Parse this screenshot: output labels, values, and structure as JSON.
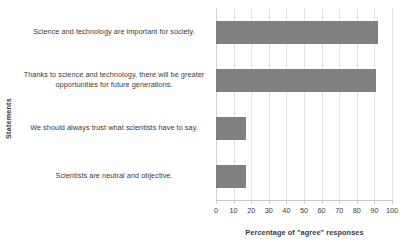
{
  "chart_data": {
    "type": "bar",
    "orientation": "horizontal",
    "title": "",
    "xlabel": "Percentage of \"agree\" responses",
    "ylabel": "Statements",
    "categories": [
      "Science and technology are important for society.",
      "Thanks to science and technology, there will be greater opportunities for future generations.",
      "We should always trust what scientists have to say.",
      "Scientists are neutral and objective."
    ],
    "values": [
      92,
      91,
      17,
      17
    ],
    "xlim": [
      0,
      100
    ],
    "xticks": [
      0,
      10,
      20,
      30,
      40,
      50,
      60,
      70,
      80,
      90,
      100
    ],
    "xtick_labels": [
      "0",
      "10",
      "20",
      "30",
      "40",
      "50",
      "60",
      "70",
      "80",
      "90",
      "100"
    ],
    "grid": true,
    "grid_axis": "x",
    "legend": false,
    "bar_color": "#808080",
    "gridline_color": "#e2e2e2",
    "axis_color": "#c9c9c9",
    "text_color": "#3a3a3a"
  }
}
